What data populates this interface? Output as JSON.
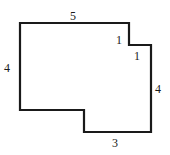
{
  "figure": {
    "type": "rectilinear-polygon",
    "stroke_color": "#1a1a1a",
    "fill_color": "#ffffff",
    "vertices": [
      [
        20,
        23
      ],
      [
        129,
        23
      ],
      [
        129,
        45
      ],
      [
        151,
        45
      ],
      [
        151,
        132
      ],
      [
        84,
        132
      ],
      [
        84,
        110
      ],
      [
        20,
        110
      ]
    ],
    "labels": {
      "top": "5",
      "notch_vertical": "1",
      "notch_horizontal": "1",
      "left": "4",
      "right": "4",
      "bottom": "3"
    }
  }
}
